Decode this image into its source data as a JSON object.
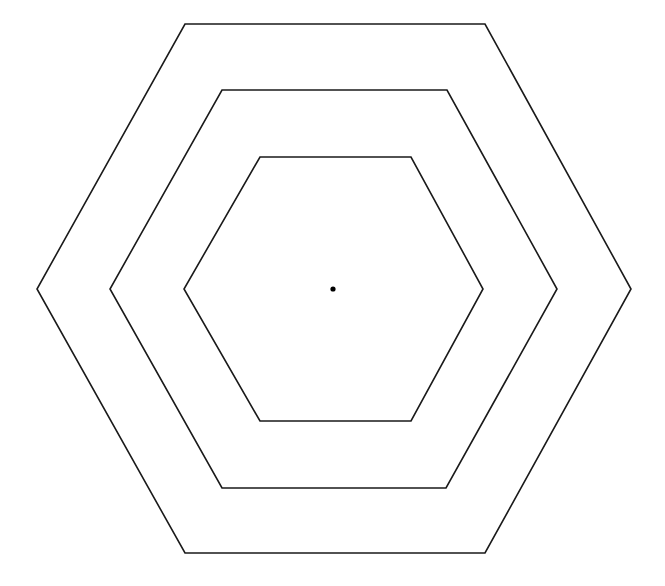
{
  "diagram": {
    "type": "concentric-hexagons",
    "canvas": {
      "width": 665,
      "height": 586,
      "background": "#ffffff"
    },
    "stroke_color": "#1a1a1a",
    "center": {
      "x": 333,
      "y": 289,
      "radius": 2.6,
      "color": "#000000"
    },
    "hexagons": [
      {
        "name": "outer",
        "points": "185,24 485,24 631,289 485,553 185,553 37,289"
      },
      {
        "name": "middle",
        "points": "222,90 447,90 557,289 446,488 222,488 110,289"
      },
      {
        "name": "inner",
        "points": "260,157 411,157 483,289 411,421 260,421 184,289"
      }
    ]
  }
}
